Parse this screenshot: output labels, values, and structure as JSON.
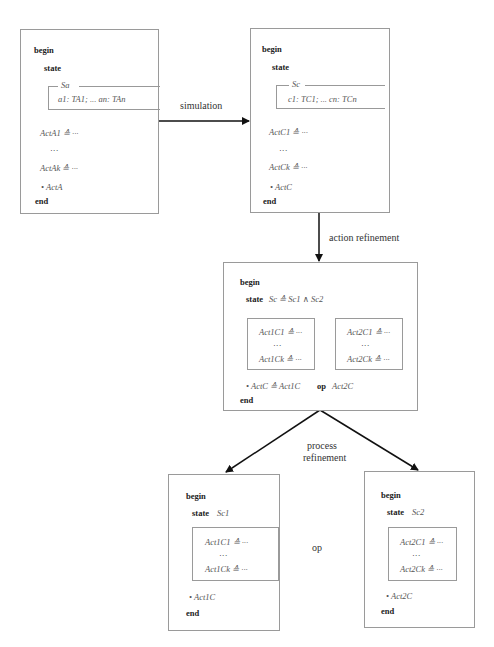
{
  "diagram": {
    "abstract_spec": {
      "begin": "begin",
      "state": "state",
      "schema_name": "Sa",
      "schema_decl": "a1: TA1; ... an: TAn",
      "action_first": "ActA1 ≙ ···",
      "ellipsis": "···",
      "action_last": "ActAk ≙ ···",
      "main": "• ActA",
      "end": "end"
    },
    "concrete_spec": {
      "begin": "begin",
      "state": "state",
      "schema_name": "Sc",
      "schema_decl": "c1: TC1; ... cn: TCn",
      "action_first": "ActC1 ≙ ···",
      "ellipsis": "···",
      "action_last": "ActCk ≙ ···",
      "main": "• ActC",
      "end": "end"
    },
    "refined_spec": {
      "begin": "begin",
      "state_kw": "state",
      "state_def": "Sc ≙ Sc1 ∧ Sc2",
      "group1": {
        "first": "Act1C1 ≙ ···",
        "ellipsis": "···",
        "last": "Act1Ck ≙ ···"
      },
      "group2": {
        "first": "Act2C1 ≙ ···",
        "ellipsis": "···",
        "last": "Act2Ck ≙ ···"
      },
      "main_pre": "• ActC ≙ Act1C",
      "main_op": "op",
      "main_post": "Act2C",
      "end": "end"
    },
    "process1": {
      "begin": "begin",
      "state_kw": "state",
      "state_name": "Sc1",
      "first": "Act1C1 ≙ ···",
      "ellipsis": "···",
      "last": "Act1Ck ≙ ···",
      "main": "• Act1C",
      "end": "end"
    },
    "process2": {
      "begin": "begin",
      "state_kw": "state",
      "state_name": "Sc2",
      "first": "Act2C1 ≙ ···",
      "ellipsis": "···",
      "last": "Act2Ck ≙ ···",
      "main": "• Act2C",
      "end": "end"
    },
    "edges": {
      "simulation": "simulation",
      "action_refinement": "action refinement",
      "process_refinement_1": "process",
      "process_refinement_2": "refinement",
      "op": "op"
    }
  }
}
